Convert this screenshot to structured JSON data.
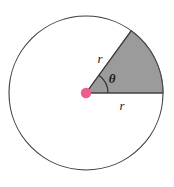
{
  "figure": {
    "background_color": "#ffffff",
    "width": 174,
    "height": 187
  },
  "circle": {
    "center_x": 86,
    "center_y": 93,
    "radius": 77,
    "stroke_color": "#3d3d3d",
    "stroke_width": 1.1,
    "fill_color": "#ffffff"
  },
  "sector": {
    "start_angle_deg": 0,
    "end_angle_deg": 54,
    "fill_color": "#9b9b9b",
    "stroke_color": "#4a4a4a",
    "stroke_width": 1.1
  },
  "center_point": {
    "color": "#ef5d8f",
    "radius": 5.2,
    "cx": 86,
    "cy": 93
  },
  "angle_arc": {
    "radius": 22,
    "stroke_color": "#2e2e2e",
    "stroke_width": 1.1
  },
  "labels": {
    "radius_slanted": {
      "text": "r",
      "x": 100,
      "y": 63
    },
    "radius_horizontal": {
      "text": "r",
      "x": 122,
      "y": 110
    },
    "angle": {
      "text": "θ",
      "x": 112,
      "y": 83
    }
  }
}
